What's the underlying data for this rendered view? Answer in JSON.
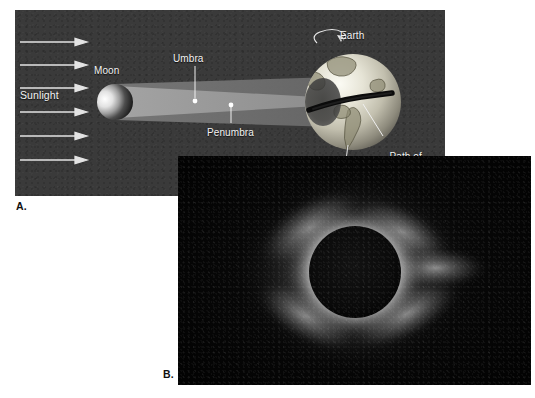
{
  "figure": {
    "kind": "two-panel scientific figure"
  },
  "panel_a": {
    "caption_letter": "A.",
    "background_color": "#3a3a3a",
    "labels": {
      "sunlight": "Sunlight",
      "moon": "Moon",
      "umbra": "Umbra",
      "penumbra": "Penumbra",
      "earth": "Earth",
      "path_line_1": "Path of",
      "path_line_2": "total solar",
      "path_line_3": "eclipse"
    },
    "elements": {
      "sunlight_arrow_count": 6,
      "arrow_color": "#e8e8e8",
      "moon_lit_side": "left",
      "moon_dark_side": "right",
      "umbra_color": "#9a9a9a",
      "penumbra_color": "#6e6e6e",
      "earth_rotation_icon": "counter-clockwise spin arrow above Earth",
      "umbral_spot_color": "#4a4a4a",
      "eclipse_path_color": "#0a0a0a",
      "leader_dot_color": "#ffffff"
    }
  },
  "panel_b": {
    "caption_letter": "B.",
    "description": "Photograph of the solar corona during a total solar eclipse",
    "sky_color": "#070707",
    "moon_disk_color": "#0c0c0c",
    "corona_color": "#ffffff",
    "streamer_count": 4
  }
}
